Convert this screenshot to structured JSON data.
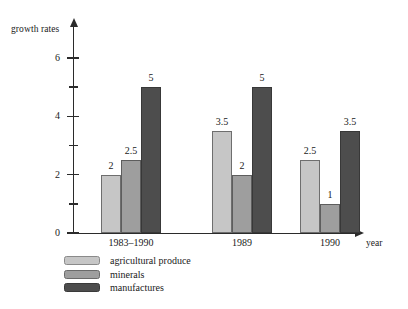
{
  "chart_data": {
    "type": "bar",
    "title": "",
    "subtitle": "",
    "xlabel": "year",
    "ylabel": "growth rates",
    "categories": [
      "1983–1990",
      "1989",
      "1990"
    ],
    "series": [
      {
        "name": "agricultural produce",
        "values": [
          2,
          3.5,
          2.5
        ],
        "color": "#c6c6c6"
      },
      {
        "name": "minerals",
        "values": [
          2.5,
          2,
          1
        ],
        "color": "#9e9e9e"
      },
      {
        "name": "manufactures",
        "values": [
          5,
          5,
          3.5
        ],
        "color": "#4d4d4d"
      }
    ],
    "value_labels": [
      [
        "2",
        "2.5",
        "5"
      ],
      [
        "3.5",
        "2",
        "5"
      ],
      [
        "2.5",
        "1",
        "3.5"
      ]
    ],
    "ylim": [
      0,
      6.6
    ],
    "y_major_ticks": [
      0,
      2,
      4,
      6
    ],
    "y_major_tick_labels": [
      "0",
      "2",
      "4",
      "6"
    ],
    "y_minor_ticks": [
      1,
      3,
      5
    ],
    "grid": false,
    "legend_position": "below-left",
    "axis_arrows": true
  },
  "axes": {
    "y_title": "growth rates",
    "x_title": "year"
  },
  "legend": {
    "items": [
      {
        "label": "agricultural produce"
      },
      {
        "label": "minerals"
      },
      {
        "label": "manufactures"
      }
    ]
  }
}
